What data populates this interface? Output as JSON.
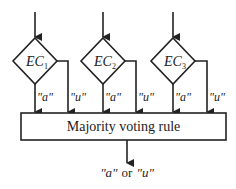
{
  "diagram": {
    "classifiers": [
      {
        "name": "EC",
        "subscript": "1"
      },
      {
        "name": "EC",
        "subscript": "2"
      },
      {
        "name": "EC",
        "subscript": "3"
      }
    ],
    "branch_labels": {
      "left": "\"a\"",
      "right": "\"u\""
    },
    "combiner": {
      "label": "Majority voting rule"
    },
    "output": {
      "option_a": "\"a\"",
      "connector": "or",
      "option_u": "\"u\""
    },
    "colors": {
      "stroke": "#222222",
      "background": "#ffffff"
    }
  }
}
